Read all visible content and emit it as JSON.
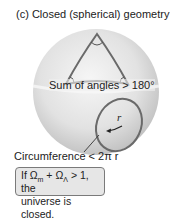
{
  "figure": {
    "title": "(c)  Closed (spherical) geometry",
    "angle_label": "Sum of angles > 180°",
    "circumference_label": "Circumference < 2π r",
    "radius_label": "r",
    "condition_box": {
      "line1_prefix": "If Ω",
      "sub_m": "m",
      "plus": " + Ω",
      "sub_lambda": "Λ",
      "line1_suffix": " > 1, the",
      "line2": "universe is closed."
    }
  },
  "colors": {
    "sphere_light": "#f4f4f4",
    "sphere_dark": "#bdbdbd",
    "outline": "#6e6e6e",
    "box_fill": "#e6e6e6"
  }
}
